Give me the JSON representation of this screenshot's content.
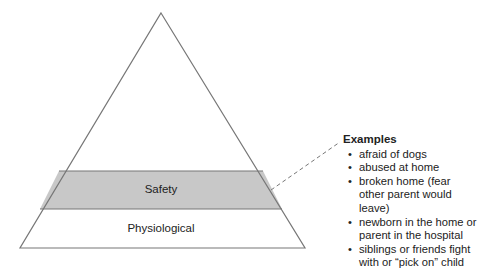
{
  "pyramid": {
    "levels": [
      {
        "name": "Safety",
        "highlighted": true,
        "fill": "#c8c8c8"
      },
      {
        "name": "Physiological",
        "highlighted": false,
        "fill": "#ffffff"
      }
    ],
    "stroke_color": "#777777"
  },
  "callout": {
    "title": "Examples",
    "items": [
      "afraid of dogs",
      "abused at home",
      "broken home (fear other parent would leave)",
      "newborn in the home or parent in the hospital",
      "siblings or friends fight with or “pick on” child"
    ]
  }
}
